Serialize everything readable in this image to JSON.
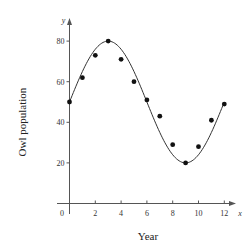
{
  "chart_data": {
    "type": "scatter",
    "title": "",
    "xlabel": "Year",
    "ylabel": "Owl population",
    "x_axis_var": "x",
    "y_axis_var": "y",
    "xlim": [
      0,
      12.8
    ],
    "ylim": [
      0,
      88
    ],
    "x_ticks": [
      0,
      2,
      4,
      6,
      8,
      10,
      12
    ],
    "y_ticks": [
      20,
      40,
      60,
      80
    ],
    "grid": false,
    "legend": null,
    "series": [
      {
        "name": "Observed population",
        "kind": "scatter",
        "x": [
          0,
          1,
          2,
          3,
          4,
          5,
          6,
          7,
          8,
          9,
          10,
          11,
          12
        ],
        "y": [
          50,
          62,
          73,
          80,
          71,
          60,
          51,
          43,
          29,
          20,
          28,
          41,
          49
        ]
      },
      {
        "name": "Sinusoidal model",
        "kind": "line",
        "formula": "y = 50 + 30*sin(pi*x/6)",
        "amplitude": 30,
        "midline": 50,
        "period": 12,
        "x_range": [
          0,
          12
        ]
      }
    ]
  },
  "labels": {
    "x_axis_title": "Year",
    "y_axis_title": "Owl population",
    "x_var": "x",
    "y_var": "y",
    "origin": "0"
  }
}
